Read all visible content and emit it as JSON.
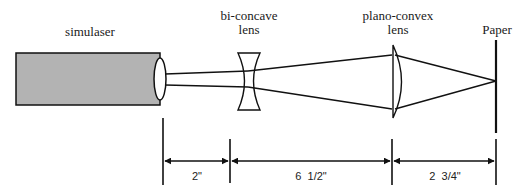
{
  "diagram": {
    "components": [
      {
        "id": "simulaser",
        "label": "simulaser"
      },
      {
        "id": "bi-concave-lens",
        "label_line1": "bi-concave",
        "label_line2": "lens"
      },
      {
        "id": "plano-convex-lens",
        "label_line1": "plano-convex",
        "label_line2": "lens"
      },
      {
        "id": "paper",
        "label": "Paper"
      }
    ],
    "dimensions": [
      {
        "from": "simulaser",
        "to": "bi-concave-lens",
        "label": "2\""
      },
      {
        "from": "bi-concave-lens",
        "to": "plano-convex-lens",
        "label": "6  1/2\""
      },
      {
        "from": "plano-convex-lens",
        "to": "paper",
        "label": "2  3/4\""
      }
    ],
    "colors": {
      "laser_fill": "#b3b3b3",
      "stroke": "#111111",
      "background": "#ffffff"
    }
  }
}
